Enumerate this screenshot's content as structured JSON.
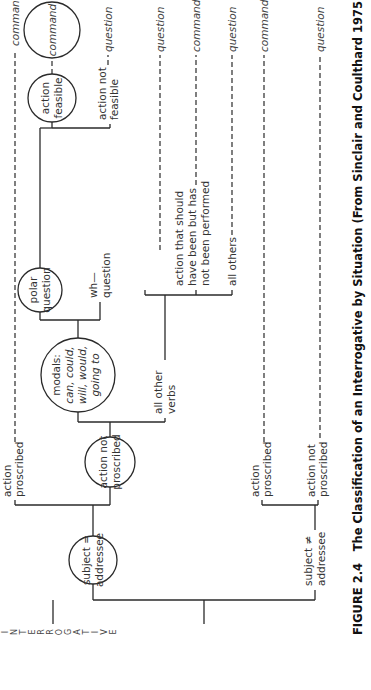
{
  "figure": {
    "number": "FIGURE 2.4",
    "caption": "The Classification of an Interrogative by Situation (From Sinclair and Coulthard 1975: 31)",
    "orientation": "rotated 90° counter-clockwise"
  },
  "root": {
    "label": "INTERROGATIVE",
    "letters": [
      "I",
      "N",
      "T",
      "E",
      "R",
      "R",
      "O",
      "G",
      "A",
      "T",
      "I",
      "V",
      "E"
    ]
  },
  "nodes": {
    "subject_eq": [
      "subject =",
      "addressee"
    ],
    "subject_neq": [
      "subject ≠",
      "addressee"
    ],
    "action_proscribed_1": [
      "action",
      "proscribed"
    ],
    "action_not_proscribed_1": [
      "action not",
      "proscribed"
    ],
    "modals": [
      "modals:",
      "can, could,",
      "will, would,",
      "going to"
    ],
    "all_other_verbs": [
      "all other",
      "verbs"
    ],
    "polar_question": [
      "polar",
      "question"
    ],
    "wh_question": [
      "wh—",
      "question"
    ],
    "action_feasible": [
      "action",
      "feasible"
    ],
    "action_not_feasible": [
      "action not",
      "feasible"
    ],
    "command_circle": [
      "command"
    ],
    "action_should": [
      "action that should",
      "have been but has",
      "not been performed"
    ],
    "all_others": [
      "all others"
    ],
    "action_proscribed_2": [
      "action",
      "proscribed"
    ],
    "action_not_proscribed_2": [
      "action not",
      "proscribed"
    ]
  },
  "outcomes": {
    "o1": "command",
    "o2": "command",
    "o3": "question",
    "o4": "question",
    "o5": "command",
    "o6": "question",
    "o7": "command",
    "o8": "question"
  },
  "colors": {
    "line": "#2a2a2a",
    "text": "#333333",
    "background": "#ffffff"
  }
}
